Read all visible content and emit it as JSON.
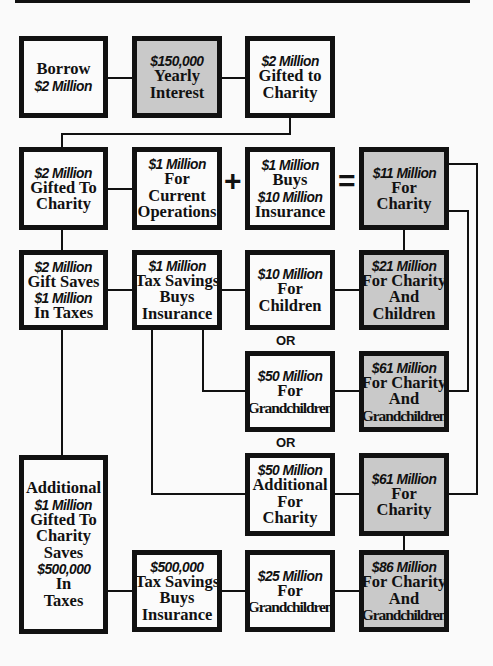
{
  "diagram": {
    "boxes": {
      "borrow": {
        "lines": [
          {
            "t": "Borrow"
          },
          {
            "t": "$2 Million",
            "em": true
          }
        ]
      },
      "interest": {
        "lines": [
          {
            "t": "$150,000",
            "em": true
          },
          {
            "t": "Yearly"
          },
          {
            "t": "Interest"
          }
        ]
      },
      "gifted1": {
        "lines": [
          {
            "t": "$2 Million",
            "em": true
          },
          {
            "t": "Gifted to"
          },
          {
            "t": "Charity"
          }
        ]
      },
      "gifted2": {
        "lines": [
          {
            "t": "$2 Million",
            "em": true
          },
          {
            "t": "Gifted To"
          },
          {
            "t": "Charity"
          }
        ]
      },
      "current_ops": {
        "lines": [
          {
            "t": "$1 Million",
            "em": true
          },
          {
            "t": "For"
          },
          {
            "t": "Current"
          },
          {
            "t": "Operations"
          }
        ]
      },
      "buys_insurance": {
        "lines": [
          {
            "t": "$1 Million",
            "em": true
          },
          {
            "t": "Buys"
          },
          {
            "t": "$10 Million",
            "em": true
          },
          {
            "t": "Insurance"
          }
        ]
      },
      "charity11": {
        "lines": [
          {
            "t": "$11 Million",
            "em": true
          },
          {
            "t": "For"
          },
          {
            "t": "Charity"
          }
        ]
      },
      "gift_saves": {
        "lines": [
          {
            "t": "$2 Million",
            "em": true
          },
          {
            "t": "Gift Saves"
          },
          {
            "t": "$1 Million",
            "em": true
          },
          {
            "t": "In Taxes"
          }
        ]
      },
      "tax_savings1": {
        "lines": [
          {
            "t": "$1 Million",
            "em": true
          },
          {
            "t": "Tax Savings"
          },
          {
            "t": "Buys"
          },
          {
            "t": "Insurance"
          }
        ]
      },
      "children10": {
        "lines": [
          {
            "t": "$10 Million",
            "em": true
          },
          {
            "t": "For"
          },
          {
            "t": "Children"
          }
        ]
      },
      "charity_children21": {
        "lines": [
          {
            "t": "$21 Million",
            "em": true
          },
          {
            "t": "For Charity"
          },
          {
            "t": "And"
          },
          {
            "t": "Children"
          }
        ]
      },
      "grandchildren50": {
        "lines": [
          {
            "t": "$50 Million",
            "em": true
          },
          {
            "t": "For"
          },
          {
            "t": "Grandchildren",
            "tight": true
          }
        ]
      },
      "charity_grand61": {
        "lines": [
          {
            "t": "$61 Million",
            "em": true
          },
          {
            "t": "For Charity"
          },
          {
            "t": "And"
          },
          {
            "t": "Grandchildren",
            "tight": true
          }
        ]
      },
      "additional50": {
        "lines": [
          {
            "t": "$50 Million",
            "em": true
          },
          {
            "t": "Additional"
          },
          {
            "t": "For"
          },
          {
            "t": "Charity"
          }
        ]
      },
      "charity61": {
        "lines": [
          {
            "t": "$61 Million",
            "em": true
          },
          {
            "t": "For"
          },
          {
            "t": "Charity"
          }
        ]
      },
      "additional_gift": {
        "lines": [
          {
            "t": "Additional"
          },
          {
            "t": "$1 Million",
            "em": true
          },
          {
            "t": "Gifted To"
          },
          {
            "t": "Charity"
          },
          {
            "t": "Saves"
          },
          {
            "t": "$500,000",
            "em": true
          },
          {
            "t": "In"
          },
          {
            "t": "Taxes"
          }
        ]
      },
      "tax_savings2": {
        "lines": [
          {
            "t": "$500,000",
            "em": true
          },
          {
            "t": "Tax Savings"
          },
          {
            "t": "Buys"
          },
          {
            "t": "Insurance"
          }
        ]
      },
      "grandchildren25": {
        "lines": [
          {
            "t": "$25 Million",
            "em": true
          },
          {
            "t": "For"
          },
          {
            "t": "Grandchildren",
            "tight": true
          }
        ]
      },
      "charity_grand86": {
        "lines": [
          {
            "t": "$86 Million",
            "em": true
          },
          {
            "t": "For Charity"
          },
          {
            "t": "And"
          },
          {
            "t": "Grandchildren",
            "tight": true
          }
        ]
      }
    },
    "operators": {
      "plus": "+",
      "equals": "="
    },
    "or_labels": [
      "OR",
      "OR"
    ],
    "colors": {
      "border": "#111111",
      "box_fill": "#fbfbfb",
      "highlight_fill": "#c9c9c9"
    }
  }
}
